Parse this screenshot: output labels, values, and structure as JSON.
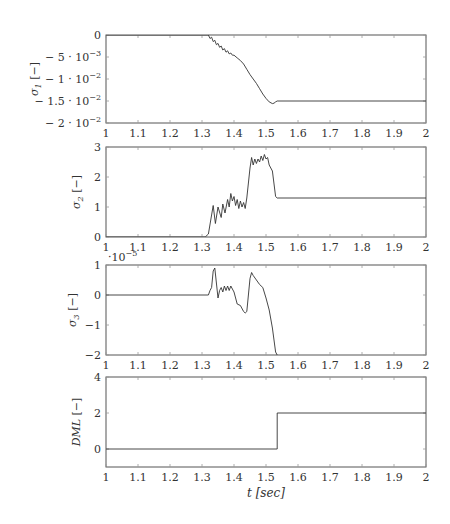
{
  "chart_data": [
    {
      "type": "line",
      "title": "",
      "ylabel": "σ1 [−]",
      "ylabel_parts": {
        "sym": "σ",
        "sub": "1",
        "unit": " [−]"
      },
      "xlabel": "",
      "xlim": [
        1,
        2
      ],
      "ylim": [
        -0.02,
        0
      ],
      "xticks": [
        1,
        1.1,
        1.2,
        1.3,
        1.4,
        1.5,
        1.6,
        1.7,
        1.8,
        1.9,
        2
      ],
      "xtick_labels": [
        "1",
        "1.1",
        "1.2",
        "1.3",
        "1.4",
        "1.5",
        "1.6",
        "1.7",
        "1.8",
        "1.9",
        "2"
      ],
      "yticks": [
        0,
        -0.005,
        -0.01,
        -0.015,
        -0.02
      ],
      "ytick_labels": [
        {
          "m": "0",
          "e": ""
        },
        {
          "m": "− 5 · 10",
          "e": "−3"
        },
        {
          "m": "− 1 · 10",
          "e": "−2"
        },
        {
          "m": "− 1.5 · 10",
          "e": "−2"
        },
        {
          "m": "− 2 · 10",
          "e": "−2"
        }
      ],
      "grid": false,
      "series": [
        {
          "name": "sigma1",
          "x": [
            1,
            1.32,
            1.325,
            1.33,
            1.335,
            1.34,
            1.345,
            1.35,
            1.355,
            1.36,
            1.365,
            1.37,
            1.375,
            1.38,
            1.385,
            1.39,
            1.395,
            1.4,
            1.41,
            1.42,
            1.43,
            1.44,
            1.45,
            1.46,
            1.47,
            1.48,
            1.49,
            1.5,
            1.51,
            1.52,
            1.525,
            1.53,
            1.535,
            2
          ],
          "y": [
            0,
            0,
            -0.0008,
            -0.0005,
            -0.0015,
            -0.0012,
            -0.0022,
            -0.0019,
            -0.0028,
            -0.0025,
            -0.0034,
            -0.0031,
            -0.0039,
            -0.0036,
            -0.0043,
            -0.0041,
            -0.0046,
            -0.0046,
            -0.0052,
            -0.0058,
            -0.0066,
            -0.0078,
            -0.009,
            -0.01,
            -0.011,
            -0.0122,
            -0.0134,
            -0.0144,
            -0.0152,
            -0.0156,
            -0.0155,
            -0.0152,
            -0.015,
            -0.015
          ]
        }
      ]
    },
    {
      "type": "line",
      "ylabel": "σ2 [−]",
      "ylabel_parts": {
        "sym": "σ",
        "sub": "2",
        "unit": " [−]"
      },
      "xlabel": "",
      "xlim": [
        1,
        2
      ],
      "ylim": [
        0,
        3
      ],
      "xticks": [
        1,
        1.1,
        1.2,
        1.3,
        1.4,
        1.5,
        1.6,
        1.7,
        1.8,
        1.9,
        2
      ],
      "xtick_labels": [
        "1",
        "1.1",
        "1.2",
        "1.3",
        "1.4",
        "1.5",
        "1.6",
        "1.7",
        "1.8",
        "1.9",
        "2"
      ],
      "yticks": [
        0,
        1,
        2,
        3
      ],
      "ytick_labels": [
        {
          "m": "0",
          "e": ""
        },
        {
          "m": "1",
          "e": ""
        },
        {
          "m": "2",
          "e": ""
        },
        {
          "m": "3",
          "e": ""
        }
      ],
      "grid": false,
      "series": [
        {
          "name": "sigma2",
          "x": [
            1,
            1.31,
            1.32,
            1.335,
            1.342,
            1.35,
            1.36,
            1.365,
            1.372,
            1.38,
            1.385,
            1.39,
            1.395,
            1.4,
            1.405,
            1.41,
            1.415,
            1.42,
            1.425,
            1.43,
            1.435,
            1.44,
            1.45,
            1.455,
            1.46,
            1.465,
            1.47,
            1.475,
            1.48,
            1.485,
            1.49,
            1.495,
            1.5,
            1.505,
            1.51,
            1.52,
            1.53,
            1.535,
            2
          ],
          "y": [
            0,
            0,
            0.1,
            1.05,
            0.45,
            1.0,
            0.65,
            1.1,
            0.8,
            1.25,
            1.0,
            1.45,
            1.2,
            1.35,
            1.05,
            1.25,
            0.95,
            1.2,
            1.0,
            1.15,
            0.95,
            1.3,
            2.3,
            2.65,
            2.4,
            2.6,
            2.45,
            2.6,
            2.5,
            2.7,
            2.55,
            2.75,
            2.6,
            2.65,
            2.4,
            2.2,
            1.35,
            1.3,
            1.3
          ]
        }
      ]
    },
    {
      "type": "line",
      "ylabel": "σ3 [−]",
      "ylabel_parts": {
        "sym": "σ",
        "sub": "3",
        "unit": " [−]"
      },
      "xlabel": "",
      "axis_multiplier": "·10^−5",
      "multiplier_parts": {
        "m": "·10",
        "e": "−5"
      },
      "xlim": [
        1,
        2
      ],
      "ylim": [
        -2,
        1
      ],
      "xticks": [
        1,
        1.1,
        1.2,
        1.3,
        1.4,
        1.5,
        1.6,
        1.7,
        1.8,
        1.9,
        2
      ],
      "xtick_labels": [
        "1",
        "1.1",
        "1.2",
        "1.3",
        "1.4",
        "1.5",
        "1.6",
        "1.7",
        "1.8",
        "1.9",
        "2"
      ],
      "yticks": [
        -2,
        -1,
        0,
        1
      ],
      "ytick_labels": [
        {
          "m": "−2",
          "e": ""
        },
        {
          "m": "−1",
          "e": ""
        },
        {
          "m": "0",
          "e": ""
        },
        {
          "m": "1",
          "e": ""
        }
      ],
      "grid": false,
      "series": [
        {
          "name": "sigma3 (×1e-5)",
          "x": [
            1,
            1.32,
            1.325,
            1.33,
            1.335,
            1.34,
            1.345,
            1.35,
            1.355,
            1.36,
            1.365,
            1.37,
            1.375,
            1.38,
            1.385,
            1.39,
            1.395,
            1.4,
            1.41,
            1.42,
            1.43,
            1.435,
            1.44,
            1.45,
            1.455,
            1.46,
            1.47,
            1.48,
            1.49,
            1.5,
            1.51,
            1.52,
            1.53,
            1.535
          ],
          "y": [
            0,
            0,
            0.15,
            0.25,
            0.8,
            0.9,
            0.4,
            -0.1,
            0.15,
            0.25,
            0.1,
            0.3,
            0.15,
            0.3,
            0.15,
            0.3,
            0.2,
            0.1,
            -0.3,
            -0.35,
            -0.55,
            -0.6,
            -0.55,
            0.55,
            0.75,
            0.65,
            0.5,
            0.35,
            0.25,
            -0.1,
            -0.5,
            -1.1,
            -1.9,
            -2.0
          ]
        }
      ]
    },
    {
      "type": "line",
      "ylabel": "DML [−]",
      "ylabel_parts": {
        "sym": "DML",
        "sub": "",
        "unit": " [−]"
      },
      "xlabel": "t [sec]",
      "xlabel_parts": {
        "sym": "t",
        "unit": " [sec]"
      },
      "xlim": [
        1,
        2
      ],
      "ylim": [
        -1,
        4
      ],
      "xticks": [
        1,
        1.1,
        1.2,
        1.3,
        1.4,
        1.5,
        1.6,
        1.7,
        1.8,
        1.9,
        2
      ],
      "xtick_labels": [
        "1",
        "1.1",
        "1.2",
        "1.3",
        "1.4",
        "1.5",
        "1.6",
        "1.7",
        "1.8",
        "1.9",
        "2"
      ],
      "yticks": [
        0,
        2,
        4
      ],
      "ytick_labels": [
        {
          "m": "0",
          "e": ""
        },
        {
          "m": "2",
          "e": ""
        },
        {
          "m": "4",
          "e": ""
        }
      ],
      "grid": false,
      "series": [
        {
          "name": "DML",
          "x": [
            1,
            1.535,
            1.535,
            2
          ],
          "y": [
            0,
            0,
            2,
            2
          ]
        }
      ]
    }
  ]
}
